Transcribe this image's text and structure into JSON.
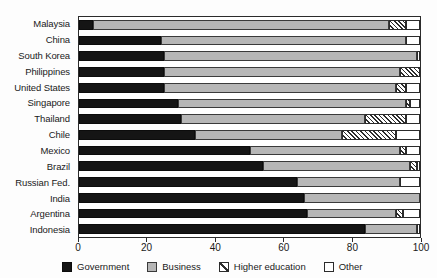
{
  "chart_data": {
    "type": "bar",
    "orientation": "horizontal",
    "stacked": true,
    "stack_unit": "percent",
    "title": "",
    "subtitle": "",
    "xlabel": "",
    "ylabel": "",
    "xlim": [
      0,
      100
    ],
    "xticks": [
      0,
      20,
      40,
      60,
      80,
      100
    ],
    "xtick_labels": [
      "0",
      "20",
      "40",
      "60",
      "80",
      "100"
    ],
    "grid": false,
    "legend_position": "bottom",
    "categories": [
      "Malaysia",
      "China",
      "South Korea",
      "Philippines",
      "United States",
      "Singapore",
      "Thailand",
      "Chile",
      "Mexico",
      "Brazil",
      "Russian Fed.",
      "India",
      "Argentina",
      "Indonesia"
    ],
    "series": [
      {
        "name": "Government",
        "color": "#151515",
        "values": [
          4,
          24,
          25,
          25,
          25,
          29,
          30,
          34,
          50,
          54,
          64,
          66,
          67,
          84
        ]
      },
      {
        "name": "Business",
        "color": "#b6b6b6",
        "values": [
          87,
          72,
          74,
          69,
          68,
          67,
          54,
          43,
          44,
          43,
          30,
          34,
          26,
          15
        ]
      },
      {
        "name": "Higher education",
        "color": "#ffffff",
        "pattern": "diagonal-hatch",
        "values": [
          5,
          0,
          0,
          6,
          3,
          1,
          12,
          16,
          2,
          2,
          0,
          0,
          2,
          0
        ]
      },
      {
        "name": "Other",
        "color": "#ffffff",
        "values": [
          4,
          4,
          1,
          0,
          4,
          3,
          4,
          7,
          4,
          1,
          6,
          0,
          5,
          1
        ]
      }
    ]
  },
  "legend": {
    "items": [
      {
        "label": "Government",
        "swatch": "government-swatch"
      },
      {
        "label": "Business",
        "swatch": "business-swatch"
      },
      {
        "label": "Higher education",
        "swatch": "higher-education-swatch"
      },
      {
        "label": "Other",
        "swatch": "other-swatch"
      }
    ]
  }
}
